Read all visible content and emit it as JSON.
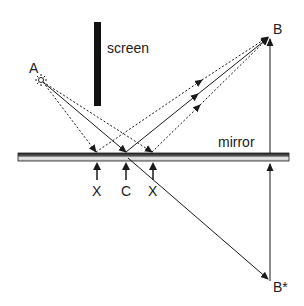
{
  "diagram": {
    "labels": {
      "source": "A",
      "target": "B",
      "image": "B*",
      "screen": "screen",
      "mirror": "mirror",
      "point_left": "X",
      "point_center": "C",
      "point_right": "X"
    },
    "colors": {
      "line": "#1a1a1a",
      "screen": "#111111",
      "mirror_dark": "#333333",
      "mirror_light": "#e8e8e8"
    },
    "points": {
      "A": [
        41,
        80
      ],
      "B": [
        270,
        37
      ],
      "B_star": [
        270,
        281
      ],
      "X_left": [
        96,
        152
      ],
      "C": [
        126,
        152
      ],
      "X_right": [
        152,
        152
      ]
    },
    "paths": [
      {
        "name": "true-path",
        "style": "solid",
        "via": "C"
      },
      {
        "name": "alt-path-left",
        "style": "dashed",
        "via": "X_left"
      },
      {
        "name": "alt-path-right",
        "style": "dashed",
        "via": "X_right"
      }
    ]
  }
}
